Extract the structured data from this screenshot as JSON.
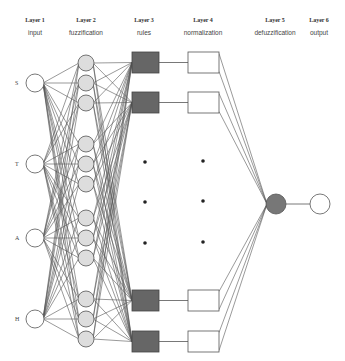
{
  "layers": [
    {
      "title": "Layer 1",
      "desc": "input"
    },
    {
      "title": "Layer 2",
      "desc": "fuzzification"
    },
    {
      "title": "Layer 3",
      "desc": "rules"
    },
    {
      "title": "Layer 4",
      "desc": "normalization"
    },
    {
      "title": "Layer 5",
      "desc": "defuzzification"
    },
    {
      "title": "Layer 6",
      "desc": "output"
    }
  ],
  "inputs": [
    "S",
    "T",
    "A",
    "H"
  ],
  "colors": {
    "line": "#555555",
    "rule_fill": "#666666",
    "fuzzy_fill": "#dddddd",
    "defuzz_fill": "#777777",
    "node_stroke": "#555555"
  }
}
